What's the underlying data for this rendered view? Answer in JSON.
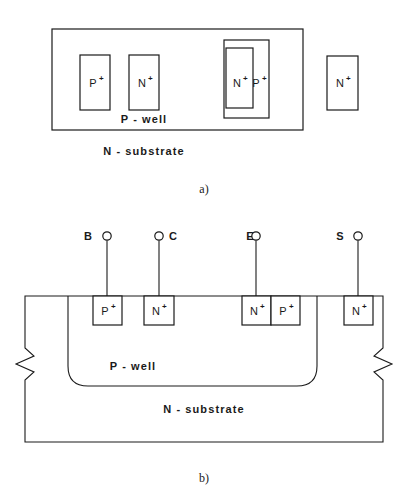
{
  "figure": {
    "panels": [
      {
        "caption": "a)",
        "type": "top-view-layout",
        "regions": [
          {
            "label": "P - well",
            "name": "p-well"
          },
          {
            "label": "N - substrate",
            "name": "n-substrate"
          }
        ],
        "diffusions": [
          {
            "dopant": "P",
            "sign": "+",
            "name": "p-plus-base"
          },
          {
            "dopant": "N",
            "sign": "+",
            "name": "n-plus-collector"
          },
          {
            "dopant": "N",
            "sign": "+",
            "name": "n-plus-emitter"
          },
          {
            "dopant": "P",
            "sign": "+",
            "name": "p-plus-emitter-ring"
          },
          {
            "dopant": "N",
            "sign": "+",
            "name": "n-plus-substrate-contact"
          }
        ]
      },
      {
        "caption": "b)",
        "type": "cross-section",
        "regions": [
          {
            "label": "P - well",
            "name": "p-well"
          },
          {
            "label": "N - substrate",
            "name": "n-substrate"
          }
        ],
        "terminals": [
          {
            "label": "B",
            "name": "terminal-base",
            "label_side": "left"
          },
          {
            "label": "C",
            "name": "terminal-collector",
            "label_side": "right"
          },
          {
            "label": "E",
            "name": "terminal-emitter",
            "label_side": "left"
          },
          {
            "label": "S",
            "name": "terminal-substrate",
            "label_side": "left"
          }
        ],
        "diffusions": [
          {
            "dopant": "P",
            "sign": "+",
            "name": "p-plus-base"
          },
          {
            "dopant": "N",
            "sign": "+",
            "name": "n-plus-collector"
          },
          {
            "dopant": "N",
            "sign": "+",
            "name": "n-plus-emitter"
          },
          {
            "dopant": "P",
            "sign": "+",
            "name": "p-plus-emitter-adjacent"
          },
          {
            "dopant": "N",
            "sign": "+",
            "name": "n-plus-substrate-contact"
          }
        ]
      }
    ]
  },
  "colors": {
    "ink": "#1a1a1a",
    "paper": "#ffffff"
  }
}
